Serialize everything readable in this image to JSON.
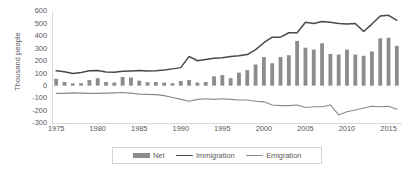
{
  "chart_data": {
    "type": "bar",
    "title": "",
    "xlabel": "",
    "ylabel": "Thousand people",
    "ylim": [
      -300,
      600
    ],
    "xlim": [
      1975,
      2016
    ],
    "yticks": [
      600,
      500,
      400,
      300,
      200,
      100,
      0,
      -100,
      -200,
      -300
    ],
    "xticks": [
      1975,
      1980,
      1985,
      1990,
      1995,
      2000,
      2005,
      2010,
      2015
    ],
    "grid": false,
    "legend_position": "bottom",
    "x": [
      1975,
      1976,
      1977,
      1978,
      1979,
      1980,
      1981,
      1982,
      1983,
      1984,
      1985,
      1986,
      1987,
      1988,
      1989,
      1990,
      1991,
      1992,
      1993,
      1994,
      1995,
      1996,
      1997,
      1998,
      1999,
      2000,
      2001,
      2002,
      2003,
      2004,
      2005,
      2006,
      2007,
      2008,
      2009,
      2010,
      2011,
      2012,
      2013,
      2014,
      2015,
      2016
    ],
    "series": [
      {
        "name": "Net",
        "type": "bar",
        "color": "#8c8c8c",
        "values": [
          55,
          30,
          18,
          20,
          45,
          60,
          30,
          25,
          70,
          65,
          40,
          28,
          30,
          25,
          20,
          38,
          45,
          25,
          30,
          75,
          85,
          60,
          105,
          125,
          170,
          230,
          180,
          230,
          245,
          360,
          305,
          290,
          340,
          255,
          250,
          290,
          250,
          240,
          275,
          380,
          385,
          320
        ]
      },
      {
        "name": "Immigration",
        "type": "line",
        "color": "#494949",
        "values": [
          120,
          112,
          98,
          105,
          120,
          122,
          110,
          108,
          115,
          118,
          122,
          118,
          120,
          125,
          135,
          145,
          235,
          200,
          210,
          220,
          225,
          235,
          240,
          250,
          290,
          345,
          390,
          390,
          425,
          425,
          510,
          500,
          515,
          510,
          500,
          495,
          500,
          435,
          495,
          560,
          565,
          525
        ]
      },
      {
        "name": "Emigration",
        "type": "line",
        "color": "#8a8a8a",
        "values": [
          -62,
          -62,
          -58,
          -60,
          -62,
          -62,
          -60,
          -58,
          -55,
          -60,
          -68,
          -70,
          -72,
          -80,
          -95,
          -110,
          -125,
          -110,
          -105,
          -110,
          -105,
          -110,
          -115,
          -115,
          -125,
          -130,
          -155,
          -160,
          -160,
          -155,
          -175,
          -170,
          -170,
          -155,
          -235,
          -210,
          -195,
          -180,
          -165,
          -170,
          -165,
          -190
        ]
      }
    ],
    "legend": [
      {
        "label": "Net",
        "marker": "bar",
        "color": "#8c8c8c"
      },
      {
        "label": "Immigration",
        "marker": "line",
        "color": "#494949"
      },
      {
        "label": "Emigration",
        "marker": "line",
        "color": "#8a8a8a"
      }
    ]
  }
}
